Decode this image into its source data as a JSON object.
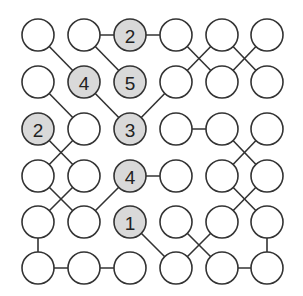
{
  "puzzle": {
    "rows": 6,
    "cols": 6,
    "colors": {
      "stroke": "#333333",
      "clue_fill": "#d9d9d9",
      "empty_fill": "#ffffff",
      "background": "#ffffff"
    },
    "col_x": [
      38,
      84,
      130,
      176,
      222,
      267
    ],
    "row_y": [
      35,
      82,
      129,
      176,
      222,
      268
    ],
    "radius": 16,
    "clues": [
      {
        "r": 0,
        "c": 2,
        "value": "2"
      },
      {
        "r": 1,
        "c": 1,
        "value": "4"
      },
      {
        "r": 1,
        "c": 2,
        "value": "5"
      },
      {
        "r": 2,
        "c": 0,
        "value": "2"
      },
      {
        "r": 2,
        "c": 2,
        "value": "3"
      },
      {
        "r": 3,
        "c": 2,
        "value": "4"
      },
      {
        "r": 4,
        "c": 2,
        "value": "1"
      }
    ],
    "edges": [
      [
        [
          0,
          1
        ],
        [
          0,
          2
        ]
      ],
      [
        [
          0,
          2
        ],
        [
          0,
          3
        ]
      ],
      [
        [
          0,
          0
        ],
        [
          1,
          1
        ]
      ],
      [
        [
          0,
          1
        ],
        [
          1,
          2
        ]
      ],
      [
        [
          0,
          3
        ],
        [
          1,
          4
        ]
      ],
      [
        [
          1,
          3
        ],
        [
          0,
          4
        ]
      ],
      [
        [
          0,
          4
        ],
        [
          1,
          5
        ]
      ],
      [
        [
          1,
          4
        ],
        [
          0,
          5
        ]
      ],
      [
        [
          1,
          0
        ],
        [
          2,
          1
        ]
      ],
      [
        [
          1,
          1
        ],
        [
          2,
          2
        ]
      ],
      [
        [
          2,
          2
        ],
        [
          1,
          3
        ]
      ],
      [
        [
          2,
          3
        ],
        [
          2,
          4
        ]
      ],
      [
        [
          2,
          4
        ],
        [
          3,
          5
        ]
      ],
      [
        [
          2,
          5
        ],
        [
          3,
          4
        ]
      ],
      [
        [
          2,
          0
        ],
        [
          3,
          1
        ]
      ],
      [
        [
          2,
          1
        ],
        [
          3,
          0
        ]
      ],
      [
        [
          3,
          0
        ],
        [
          4,
          1
        ]
      ],
      [
        [
          3,
          1
        ],
        [
          4,
          0
        ]
      ],
      [
        [
          3,
          2
        ],
        [
          4,
          1
        ]
      ],
      [
        [
          3,
          2
        ],
        [
          3,
          3
        ]
      ],
      [
        [
          4,
          0
        ],
        [
          5,
          0
        ]
      ],
      [
        [
          5,
          0
        ],
        [
          5,
          1
        ]
      ],
      [
        [
          5,
          1
        ],
        [
          5,
          2
        ]
      ],
      [
        [
          4,
          2
        ],
        [
          5,
          3
        ]
      ],
      [
        [
          3,
          4
        ],
        [
          4,
          5
        ]
      ],
      [
        [
          3,
          5
        ],
        [
          4,
          4
        ]
      ],
      [
        [
          4,
          3
        ],
        [
          5,
          4
        ]
      ],
      [
        [
          4,
          4
        ],
        [
          5,
          3
        ]
      ],
      [
        [
          4,
          5
        ],
        [
          5,
          5
        ]
      ],
      [
        [
          5,
          4
        ],
        [
          5,
          5
        ]
      ]
    ]
  }
}
